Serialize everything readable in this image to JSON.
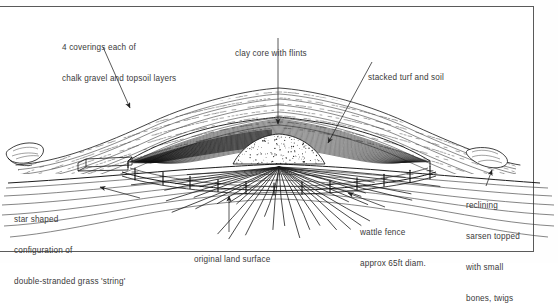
{
  "figure": {
    "kind": "archaeological-cross-section",
    "frame_color": "#5a5a5a",
    "ink_color": "#222222",
    "text_color": "#3a3a3a",
    "background": "#ffffff"
  },
  "labels": {
    "coverings": {
      "line1": "4 coverings each of",
      "line2": "chalk gravel and topsoil layers"
    },
    "clay_core": {
      "line1": "clay core with flints"
    },
    "stacked_turf": {
      "line1": "stacked turf and soil"
    },
    "star_string": {
      "line1": "star shaped",
      "line2": "configuration of",
      "line3": "double-stranded grass 'string'"
    },
    "land_surface": {
      "line1": "original land surface"
    },
    "wattle_fence": {
      "line1": "wattle fence",
      "line2": "approx 65ft diam."
    },
    "sarsen": {
      "line1": "reclining",
      "line2": "sarsen topped",
      "line3": "with small",
      "line4": "bones, twigs"
    }
  },
  "annotation_targets": {
    "coverings_arrow": "outer chalk gravel and topsoil layer band, left flank",
    "clay_core_arrow": "central clay core beneath mound apex",
    "stacked_turf_arrow": "stacked turf and soil zone, right of core",
    "star_string_arrow": "radiating grass string lines below land surface, left",
    "land_surface_arrow": "original ground surface line, centre",
    "wattle_fence_arrow": "wattle fence posts ring, right of centre",
    "sarsen_arrow": "reclining sarsen stone at right mound toe"
  }
}
